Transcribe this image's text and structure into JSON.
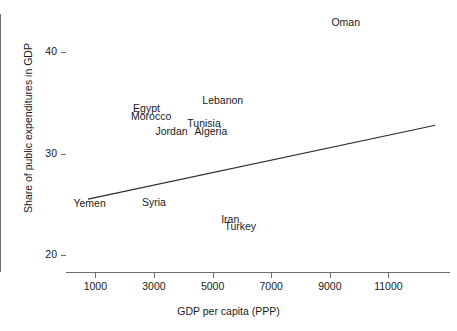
{
  "chart_data": {
    "type": "scatter",
    "title": "",
    "xlabel": "GDP per capita (PPP)",
    "ylabel": "Share of public expenditures in GDP",
    "xlim": [
      0,
      13100
    ],
    "ylim": [
      18.3,
      43.8
    ],
    "grid": false,
    "legend": null,
    "xticks": [
      1000,
      3000,
      5000,
      7000,
      9000,
      11000
    ],
    "yticks": [
      20,
      30,
      40
    ],
    "xtick_labels": [
      "1000",
      "3000",
      "5000",
      "7000",
      "9000",
      "11000"
    ],
    "ytick_labels": [
      "20",
      "30",
      "40"
    ],
    "marker_style": "text-label-only",
    "points": [
      {
        "label": "Oman",
        "x": 9550,
        "y": 43.0
      },
      {
        "label": "Lebanon",
        "x": 5350,
        "y": 35.3
      },
      {
        "label": "Egypt",
        "x": 2750,
        "y": 34.5
      },
      {
        "label": "Morocco",
        "x": 2900,
        "y": 33.7
      },
      {
        "label": "Tunisia",
        "x": 4700,
        "y": 33.0
      },
      {
        "label": "Jordan",
        "x": 3600,
        "y": 32.2
      },
      {
        "label": "Algeria",
        "x": 4950,
        "y": 32.2
      },
      {
        "label": "Yemen",
        "x": 800,
        "y": 25.1
      },
      {
        "label": "Syria",
        "x": 3000,
        "y": 25.2
      },
      {
        "label": "Iran",
        "x": 5600,
        "y": 23.5
      },
      {
        "label": "Turkey",
        "x": 5950,
        "y": 22.8
      }
    ],
    "trend_line": {
      "name": "regression-line",
      "x_start": 750,
      "y_start": 25.5,
      "x_end": 12600,
      "y_end": 32.8
    },
    "colors": {
      "axis": "#6e6e6e",
      "text": "#1a1a1a",
      "line": "#2b2b2b",
      "background": "#ffffff"
    }
  },
  "axes": {
    "y_title": "Share of public expenditures in GDP",
    "x_title": "GDP per capita (PPP)"
  }
}
